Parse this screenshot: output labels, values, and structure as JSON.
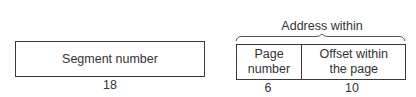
{
  "diagram": {
    "type": "address-format",
    "segment_field": {
      "label": "Segment number",
      "bits": "18"
    },
    "address_within_segment": {
      "title_line1": "Address within",
      "title_line2": "the segment",
      "fields": [
        {
          "label_line1": "Page",
          "label_line2": "number",
          "bits": "6"
        },
        {
          "label_line1": "Offset within",
          "label_line2": "the page",
          "bits": "10"
        }
      ]
    },
    "colors": {
      "line": "#3a3a3a",
      "text": "#333333",
      "background": "#ffffff"
    }
  }
}
